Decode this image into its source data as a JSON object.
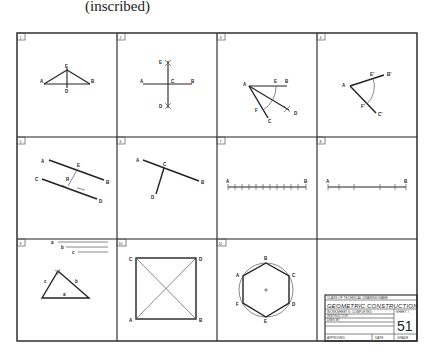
{
  "caption": "(inscribed)",
  "sheet": {
    "cells": [
      {
        "number": "1",
        "labels": {
          "A": "A",
          "B": "B",
          "E": "E",
          "D": "D"
        }
      },
      {
        "number": "2",
        "labels": {
          "A": "A",
          "B": "B",
          "C": "C",
          "E": "E",
          "D": "D"
        }
      },
      {
        "number": "3",
        "labels": {
          "A": "A",
          "E": "E",
          "B": "B",
          "F": "F",
          "C": "C",
          "D": "D"
        }
      },
      {
        "number": "4",
        "labels": {
          "A": "A",
          "E": "E'",
          "B": "B'",
          "F": "F'",
          "C": "C'"
        }
      },
      {
        "number": "5",
        "labels": {
          "A": "A",
          "B": "B",
          "C": "C",
          "D": "D",
          "E": "E",
          "R": "R"
        }
      },
      {
        "number": "6",
        "labels": {
          "A": "A",
          "B": "B",
          "C": "C",
          "D": "D"
        }
      },
      {
        "number": "7",
        "labels": {
          "A": "A",
          "B": "B"
        }
      },
      {
        "number": "8",
        "labels": {
          "A": "A",
          "B": "B"
        }
      },
      {
        "number": "9",
        "labels": {
          "a": "a",
          "b": "b",
          "c": "c",
          "a2": "a",
          "b2": "b",
          "c2": "c"
        }
      },
      {
        "number": "10",
        "labels": {
          "A": "A",
          "B": "B",
          "C": "C",
          "D": "D"
        }
      },
      {
        "number": "11",
        "labels": {
          "A": "A",
          "B": "B",
          "C": "C",
          "D": "D",
          "E": "E",
          "F": "F"
        }
      }
    ],
    "title_block": {
      "school": "CLASS OF TECHNICAL DRAWING NAME",
      "title": "GEOMETRIC CONSTRUCTION",
      "worksheet": "WORKSHEET 6: COMPLETED",
      "line2": "INSTRUCTOR",
      "line3": "DWG BY",
      "sheet_label": "SHEET #",
      "sheet_number": "51",
      "approved": "APPROVED",
      "date": "DATE",
      "grade": "GRADE"
    }
  }
}
